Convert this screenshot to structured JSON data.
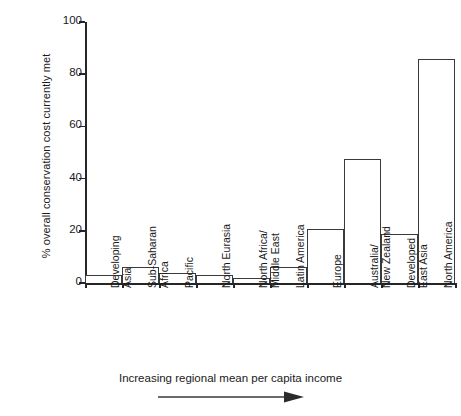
{
  "chart_data": {
    "type": "bar",
    "title": "",
    "xlabel": "Increasing regional mean per capita income",
    "ylabel": "% overall conservation cost currently met",
    "ylim": [
      0,
      100
    ],
    "yticks": [
      0,
      20,
      40,
      60,
      80,
      100
    ],
    "grid": false,
    "legend": null,
    "categories": [
      "Developing\nAsia",
      "Sub-Saharan\nAfrica",
      "Pacific",
      "North Eurasia",
      "North Africa/\nMiddle East",
      "Latin America",
      "Europe",
      "Australia/\nNew Zealand",
      "Developed\nEast Asia",
      "North America"
    ],
    "values": [
      3,
      6,
      4,
      3,
      2,
      6,
      20.5,
      47.5,
      18.8,
      86
    ],
    "annotations": [
      {
        "name": "income-arrow",
        "text": "Increasing regional mean per capita income",
        "direction": "right"
      }
    ]
  },
  "axis": {
    "y_title": "% overall conservation cost currently met",
    "y_tick_labels": [
      "0",
      "20",
      "40",
      "60",
      "80",
      "100"
    ],
    "x_caption": "Increasing regional mean per capita income"
  },
  "bars": [
    {
      "label": "Developing\nAsia",
      "value": 3
    },
    {
      "label": "Sub-Saharan\nAfrica",
      "value": 6
    },
    {
      "label": "Pacific",
      "value": 4
    },
    {
      "label": "North Eurasia",
      "value": 3
    },
    {
      "label": "North Africa/\nMiddle East",
      "value": 2
    },
    {
      "label": "Latin America",
      "value": 6
    },
    {
      "label": "Europe",
      "value": 20.5
    },
    {
      "label": "Australia/\nNew Zealand",
      "value": 47.5
    },
    {
      "label": "Developed\nEast Asia",
      "value": 18.8
    },
    {
      "label": "North America",
      "value": 86
    }
  ],
  "colors": {
    "bar_fill": "#ffffff",
    "bar_stroke": "#3a3a3a",
    "axis": "#262626",
    "text": "#1a1a1a",
    "background": "#ffffff"
  }
}
